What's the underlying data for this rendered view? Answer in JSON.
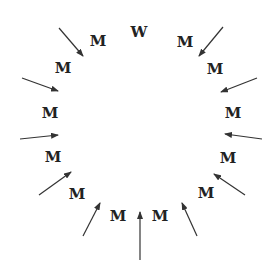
{
  "diagram": {
    "type": "circular-letter-arrangement",
    "colors": {
      "text": "#222222",
      "arrow": "#333333",
      "background": "#ffffff"
    },
    "letters": [
      {
        "text": "W",
        "x": 139,
        "y": 37
      },
      {
        "text": "M",
        "x": 98,
        "y": 46
      },
      {
        "text": "M",
        "x": 63,
        "y": 73
      },
      {
        "text": "M",
        "x": 50,
        "y": 118
      },
      {
        "text": "M",
        "x": 53,
        "y": 162
      },
      {
        "text": "M",
        "x": 77,
        "y": 199
      },
      {
        "text": "M",
        "x": 118,
        "y": 221
      },
      {
        "text": "M",
        "x": 160,
        "y": 221
      },
      {
        "text": "M",
        "x": 206,
        "y": 198
      },
      {
        "text": "M",
        "x": 228,
        "y": 163
      },
      {
        "text": "M",
        "x": 233,
        "y": 118
      },
      {
        "text": "M",
        "x": 215,
        "y": 74
      },
      {
        "text": "M",
        "x": 185,
        "y": 47
      }
    ],
    "arrows": [
      {
        "x1": 59,
        "y1": 28,
        "x2": 83,
        "y2": 56
      },
      {
        "x1": 22,
        "y1": 78,
        "x2": 58,
        "y2": 91
      },
      {
        "x1": 20,
        "y1": 139,
        "x2": 58,
        "y2": 135
      },
      {
        "x1": 39,
        "y1": 195,
        "x2": 71,
        "y2": 172
      },
      {
        "x1": 83,
        "y1": 236,
        "x2": 100,
        "y2": 203
      },
      {
        "x1": 140,
        "y1": 260,
        "x2": 140,
        "y2": 212
      },
      {
        "x1": 197,
        "y1": 236,
        "x2": 182,
        "y2": 203
      },
      {
        "x1": 245,
        "y1": 195,
        "x2": 214,
        "y2": 174
      },
      {
        "x1": 262,
        "y1": 139,
        "x2": 225,
        "y2": 134
      },
      {
        "x1": 257,
        "y1": 78,
        "x2": 221,
        "y2": 92
      },
      {
        "x1": 223,
        "y1": 27,
        "x2": 199,
        "y2": 56
      }
    ]
  }
}
